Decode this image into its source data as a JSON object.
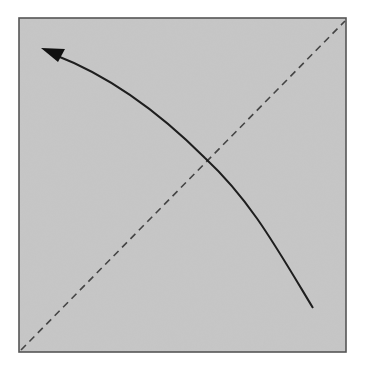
{
  "diagram": {
    "type": "rotation-diagram",
    "canvas": {
      "width": 365,
      "height": 367,
      "background": "#ffffff"
    },
    "square": {
      "x": 19,
      "y": 18,
      "width": 327,
      "height": 334,
      "fill": "#c6c6c6",
      "stroke": "#555555"
    },
    "diagonal": {
      "style": "dashed",
      "from": [
        20,
        351
      ],
      "to": [
        345,
        20
      ],
      "color": "#444444"
    },
    "curved_arrow": {
      "path": "M 313 308 C 275 245, 250 200, 205 158 C 165 118, 115 78, 52 54",
      "color": "#1e1e1e",
      "head_direction": "upper-left",
      "head_tip": [
        41,
        48
      ]
    }
  }
}
